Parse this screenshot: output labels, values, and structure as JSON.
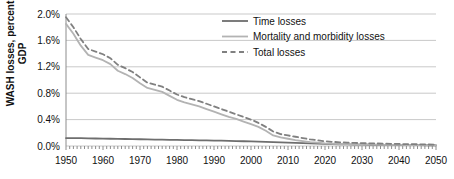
{
  "chart_data": {
    "type": "line",
    "title": "",
    "xlabel": "",
    "ylabel": "WASH losses, percent GDP",
    "xlim": [
      1950,
      2050
    ],
    "ylim": [
      0.0,
      2.0
    ],
    "grid": true,
    "legend_position": "top-right",
    "x_tick_labels": [
      "1950",
      "1960",
      "1970",
      "1980",
      "1990",
      "2000",
      "2010",
      "2020",
      "2030",
      "2040",
      "2050"
    ],
    "y_tick_labels": [
      "0.0%",
      "0.4%",
      "0.8%",
      "1.2%",
      "1.6%",
      "2.0%"
    ],
    "y_tick_values": [
      0.0,
      0.4,
      0.8,
      1.2,
      1.6,
      2.0
    ],
    "x": [
      1950,
      1952,
      1954,
      1956,
      1958,
      1960,
      1962,
      1964,
      1966,
      1968,
      1970,
      1972,
      1974,
      1976,
      1978,
      1980,
      1982,
      1984,
      1986,
      1988,
      1990,
      1992,
      1994,
      1996,
      1998,
      2000,
      2002,
      2004,
      2006,
      2008,
      2010,
      2012,
      2014,
      2016,
      2018,
      2020,
      2022,
      2024,
      2026,
      2028,
      2030,
      2032,
      2034,
      2036,
      2038,
      2040,
      2042,
      2044,
      2046,
      2048,
      2050
    ],
    "series": [
      {
        "name": "Time losses",
        "style": "solid",
        "color": "#6e6e6e",
        "width": 1.8,
        "values": [
          0.12,
          0.12,
          0.118,
          0.116,
          0.114,
          0.112,
          0.11,
          0.108,
          0.106,
          0.104,
          0.102,
          0.1,
          0.098,
          0.096,
          0.094,
          0.092,
          0.09,
          0.088,
          0.086,
          0.084,
          0.082,
          0.08,
          0.078,
          0.075,
          0.072,
          0.07,
          0.067,
          0.064,
          0.06,
          0.056,
          0.052,
          0.048,
          0.044,
          0.04,
          0.036,
          0.032,
          0.029,
          0.026,
          0.024,
          0.022,
          0.02,
          0.019,
          0.018,
          0.017,
          0.016,
          0.015,
          0.014,
          0.013,
          0.012,
          0.011,
          0.01
        ]
      },
      {
        "name": "Mortality and morbidity losses",
        "style": "solid",
        "color": "#b3b3b3",
        "width": 1.8,
        "values": [
          1.85,
          1.7,
          1.52,
          1.38,
          1.34,
          1.3,
          1.24,
          1.14,
          1.09,
          1.03,
          0.95,
          0.88,
          0.85,
          0.82,
          0.76,
          0.7,
          0.66,
          0.63,
          0.6,
          0.56,
          0.52,
          0.48,
          0.44,
          0.41,
          0.37,
          0.33,
          0.29,
          0.23,
          0.16,
          0.13,
          0.11,
          0.09,
          0.075,
          0.06,
          0.05,
          0.04,
          0.034,
          0.03,
          0.027,
          0.025,
          0.023,
          0.021,
          0.02,
          0.018,
          0.017,
          0.016,
          0.015,
          0.014,
          0.013,
          0.012,
          0.011
        ]
      },
      {
        "name": "Total losses",
        "style": "dashed",
        "color": "#808080",
        "width": 1.8,
        "values": [
          1.95,
          1.8,
          1.62,
          1.47,
          1.43,
          1.39,
          1.33,
          1.23,
          1.18,
          1.12,
          1.04,
          0.96,
          0.93,
          0.9,
          0.84,
          0.78,
          0.74,
          0.71,
          0.68,
          0.64,
          0.6,
          0.56,
          0.52,
          0.48,
          0.44,
          0.4,
          0.35,
          0.29,
          0.22,
          0.18,
          0.16,
          0.14,
          0.12,
          0.1,
          0.086,
          0.072,
          0.063,
          0.056,
          0.051,
          0.047,
          0.043,
          0.04,
          0.038,
          0.035,
          0.033,
          0.031,
          0.029,
          0.027,
          0.025,
          0.023,
          0.021
        ]
      }
    ]
  },
  "legend": {
    "items": [
      {
        "label": "Time losses"
      },
      {
        "label": "Mortality and morbidity losses"
      },
      {
        "label": "Total losses"
      }
    ]
  },
  "colors": {
    "grid": "#c9c9c9",
    "axis": "#8c8c8c",
    "text": "#111111",
    "time_losses": "#6e6e6e",
    "mortality_losses": "#b3b3b3",
    "total_losses": "#808080"
  }
}
